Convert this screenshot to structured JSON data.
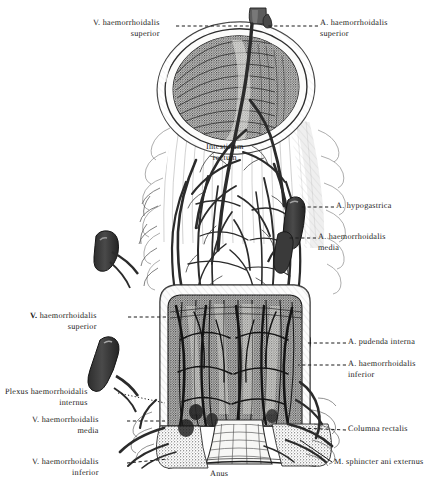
{
  "plate": {
    "title": "Rectum and anal canal with haemorrhoidal vessels",
    "style": "vintage anatomical engraving",
    "ink_color": "#1a1a1a",
    "paper_color": "#ffffff"
  },
  "labels": [
    {
      "id": "v-haem-sup-top",
      "text": "V. haemorrhoidalis\nsuperior",
      "side": "left",
      "x": 93,
      "y": 18,
      "bold_first": false
    },
    {
      "id": "a-haem-sup",
      "text": "A. haemorrhoidalis\nsuperior",
      "side": "right",
      "x": 320,
      "y": 18,
      "bold_first": false
    },
    {
      "id": "intestinum-rectum",
      "text": "Intestinum\nrectum",
      "side": "center",
      "x": 206,
      "y": 142,
      "bold_first": false
    },
    {
      "id": "a-hypogastrica",
      "text": "A. hypogastrica",
      "side": "right",
      "x": 336,
      "y": 201,
      "bold_first": false
    },
    {
      "id": "a-haem-media",
      "text": "A. haemorrhoidalis\nmedia",
      "side": "right",
      "x": 318,
      "y": 232,
      "bold_first": false
    },
    {
      "id": "v-haem-sup-mid",
      "text": "V. haemorrhoidalis\nsuperior",
      "side": "left",
      "x": 30,
      "y": 311,
      "bold_first": true
    },
    {
      "id": "a-pudenda-int",
      "text": "A. pudenda interna",
      "side": "right",
      "x": 348,
      "y": 337,
      "bold_first": false
    },
    {
      "id": "a-haem-inf",
      "text": "A. haemorrhoidalis\ninferior",
      "side": "right",
      "x": 348,
      "y": 359,
      "bold_first": false
    },
    {
      "id": "plexus-haem-int",
      "text": "Plexus haemorrhoidalis\ninternus",
      "side": "left",
      "x": 5,
      "y": 387,
      "bold_first": false
    },
    {
      "id": "v-haem-media",
      "text": "V. haemorrhoidalis\nmedia",
      "side": "left",
      "x": 32,
      "y": 415,
      "bold_first": false
    },
    {
      "id": "columna-rectalis",
      "text": "Columna rectalis",
      "side": "right",
      "x": 348,
      "y": 424,
      "bold_first": false
    },
    {
      "id": "m-sphincter",
      "text": "M. sphincter ani externus",
      "side": "right",
      "x": 334,
      "y": 457,
      "bold_first": false
    },
    {
      "id": "v-haem-inf",
      "text": "V. haemorrhoidalis\ninferior",
      "side": "left",
      "x": 32,
      "y": 457,
      "bold_first": false
    },
    {
      "id": "anus",
      "text": "Anus",
      "side": "center",
      "x": 210,
      "y": 469,
      "bold_first": false
    }
  ],
  "leader_lines": [
    {
      "id": "leader-v-haem-sup-top",
      "style": "dashed",
      "from": [
        176,
        26
      ],
      "to": [
        252,
        26
      ]
    },
    {
      "id": "leader-a-haem-sup",
      "style": "dashed",
      "from": [
        318,
        26
      ],
      "to": [
        268,
        26
      ]
    },
    {
      "id": "leader-a-hypogastrica",
      "style": "dashed",
      "from": [
        334,
        207
      ],
      "to": [
        300,
        207
      ]
    },
    {
      "id": "leader-a-haem-media",
      "style": "dashed",
      "from": [
        316,
        238
      ],
      "to": [
        288,
        238
      ]
    },
    {
      "id": "leader-v-haem-sup-mid",
      "style": "dashed",
      "from": [
        128,
        317
      ],
      "to": [
        166,
        317
      ]
    },
    {
      "id": "leader-a-pudenda-int",
      "style": "dashed",
      "from": [
        346,
        343
      ],
      "to": [
        306,
        343
      ]
    },
    {
      "id": "leader-a-haem-inf",
      "style": "dashed",
      "from": [
        346,
        365
      ],
      "to": [
        298,
        365
      ]
    },
    {
      "id": "leader-plexus-haem",
      "style": "dotted",
      "from": [
        118,
        393
      ],
      "to": [
        165,
        403
      ]
    },
    {
      "id": "leader-v-haem-media",
      "style": "dashed",
      "from": [
        127,
        421
      ],
      "to": [
        165,
        421
      ]
    },
    {
      "id": "leader-columna",
      "style": "dashed",
      "from": [
        346,
        430
      ],
      "to": [
        300,
        428
      ]
    },
    {
      "id": "leader-m-sphincter",
      "style": "solid",
      "from": [
        332,
        462
      ],
      "to": [
        300,
        440
      ]
    },
    {
      "id": "leader-v-haem-inf",
      "style": "dashed",
      "from": [
        127,
        463
      ],
      "to": [
        168,
        459
      ]
    }
  ],
  "anatomy": {
    "regions": [
      {
        "id": "rectal-lumen",
        "name": "open rectal lumen",
        "desc": "dark elliptical cavity at top with pale cut rim"
      },
      {
        "id": "rectum-wall",
        "name": "Intestinum rectum",
        "desc": "upper rectal tube covered by branching vessels"
      },
      {
        "id": "mucosal-window",
        "name": "opened rectal wall",
        "desc": "stippled submucosal plexus window"
      },
      {
        "id": "anal-canal",
        "name": "anal canal with columnae rectales"
      },
      {
        "id": "sphincter",
        "name": "M. sphincter ani externus"
      }
    ],
    "vessel_stumps": [
      {
        "id": "a-haem-sup-stump",
        "x": 258,
        "y": 20
      },
      {
        "id": "a-hypogastrica-stump",
        "x": 294,
        "y": 207
      },
      {
        "id": "a-haem-media-stump",
        "x": 284,
        "y": 240
      },
      {
        "id": "v-lateral-left-1",
        "x": 104,
        "y": 243
      },
      {
        "id": "a-pudenda-stump",
        "x": 302,
        "y": 342
      },
      {
        "id": "a-haem-inf-stump",
        "x": 296,
        "y": 366
      },
      {
        "id": "v-lateral-left-2",
        "x": 108,
        "y": 350
      }
    ]
  }
}
